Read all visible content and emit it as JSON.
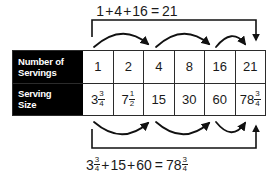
{
  "diagram": {
    "type": "doubling-pattern-table-with-arrows",
    "top_equation": {
      "terms": [
        "1",
        "4",
        "16"
      ],
      "result": "21",
      "text_plain": "1+4+16 = 21",
      "parts": {
        "a": "1",
        "plus1": "+",
        "b": "4",
        "plus2": "+",
        "c": "16",
        "equals": "=",
        "result": "21"
      }
    },
    "bottom_equation": {
      "text_plain": "3 3/4 + 15 + 60 = 78 3/4",
      "parts": {
        "a_whole": "3",
        "a_num": "3",
        "a_den": "4",
        "plus1": "+",
        "b": "15",
        "plus2": "+",
        "c": "60",
        "equals": "=",
        "r_whole": "78",
        "r_num": "3",
        "r_den": "4"
      }
    },
    "table": {
      "rows": [
        {
          "label_line1": "Number of",
          "label_line2": "Servings",
          "cells": [
            {
              "text": "1"
            },
            {
              "text": "2"
            },
            {
              "text": "4"
            },
            {
              "text": "8"
            },
            {
              "text": "16"
            },
            {
              "text": "21"
            }
          ]
        },
        {
          "label_line1": "Serving",
          "label_line2": "Size",
          "cells": [
            {
              "whole": "3",
              "num": "3",
              "den": "4"
            },
            {
              "whole": "7",
              "num": "1",
              "den": "2"
            },
            {
              "text": "15"
            },
            {
              "text": "30"
            },
            {
              "text": "60"
            },
            {
              "whole": "78",
              "num": "3",
              "den": "4"
            }
          ]
        }
      ]
    },
    "colors": {
      "label_background": "#000000",
      "label_text": "#ffffff",
      "grid_line": "#2b2b2b",
      "text": "#1a1a1a",
      "arrow": "#111111",
      "page_background": "#ffffff"
    },
    "annotations": {
      "top_bracket": "spans column 1 through column 6, arrow points down into column 6",
      "top_curved_arrows": "three arcs: col1 to col3, col3 to col5, col5 to col6",
      "bottom_bracket": "spans column 1 through column 6, arrow points up into column 6",
      "bottom_curved_arrows": "three arcs: col1 to col3, col3 to col5, col5 to col6"
    }
  }
}
